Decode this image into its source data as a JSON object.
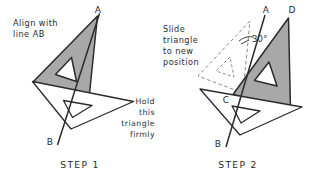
{
  "figure": {
    "background_color": "#ffffff",
    "ink_color": "#2b2b2b",
    "shaded_triangle_fill": "#a8a8a8",
    "white_triangle_fill": "#ffffff",
    "ghost_stroke_color": "#8c8c8c"
  },
  "panels": [
    {
      "id": "step-1",
      "step_label": "STEP 1",
      "instruction": {
        "align": "left",
        "lines": [
          "Align with",
          "line AB"
        ]
      },
      "note": {
        "align": "right",
        "lines": [
          "Hold",
          "this",
          "triangle",
          "firmly"
        ]
      },
      "vertices": [
        {
          "label": "A"
        },
        {
          "label": "B"
        }
      ]
    },
    {
      "id": "step-2",
      "step_label": "STEP 2",
      "instruction": {
        "align": "left",
        "lines": [
          "Slide",
          "triangle",
          "to new",
          "position"
        ]
      },
      "angle_annotation": "30°",
      "vertices": [
        {
          "label": "A"
        },
        {
          "label": "D"
        },
        {
          "label": "C"
        },
        {
          "label": "B"
        }
      ]
    }
  ]
}
